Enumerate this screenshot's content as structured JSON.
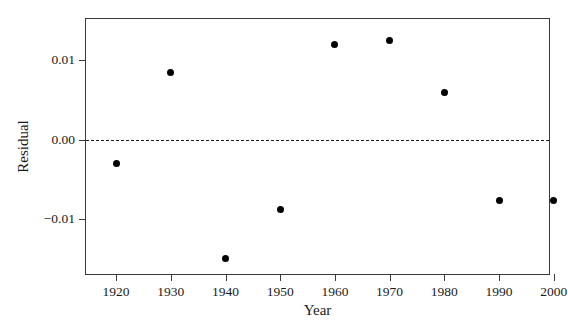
{
  "chart_data": {
    "type": "scatter",
    "title": "",
    "xlabel": "Year",
    "ylabel": "Residual",
    "x": [
      1920,
      1930,
      1940,
      1950,
      1960,
      1970,
      1980,
      1990,
      2000
    ],
    "values": [
      -0.003,
      0.0084,
      -0.0149,
      -0.0088,
      0.0119,
      0.0124,
      0.0059,
      -0.0076,
      -0.0076
    ],
    "series": [
      {
        "name": "Residual",
        "values": [
          -0.003,
          0.0084,
          -0.0149,
          -0.0088,
          0.0119,
          0.0124,
          0.0059,
          -0.0076,
          -0.0076
        ]
      }
    ],
    "xlim": [
      1914.5,
      1999.5
    ],
    "ylim": [
      -0.0171,
      0.0151
    ],
    "xticks": [
      1920,
      1930,
      1940,
      1950,
      1960,
      1970,
      1980,
      1990,
      2000
    ],
    "xtick_labels": [
      "1920",
      "1930",
      "1940",
      "1950",
      "1960",
      "1970",
      "1980",
      "1990",
      "2000"
    ],
    "yticks": [
      0.01,
      0.0,
      -0.01
    ],
    "ytick_labels": [
      "0.01",
      "0.00",
      "−0.01"
    ],
    "grid": false,
    "legend": false,
    "reference_line": {
      "value": 0.0,
      "style": "dashed",
      "color": "#1a1a1a"
    },
    "marker": {
      "shape": "circle",
      "color": "#000000",
      "size": 7
    },
    "frame_color": "#3a3a3a",
    "background": "#ffffff"
  }
}
